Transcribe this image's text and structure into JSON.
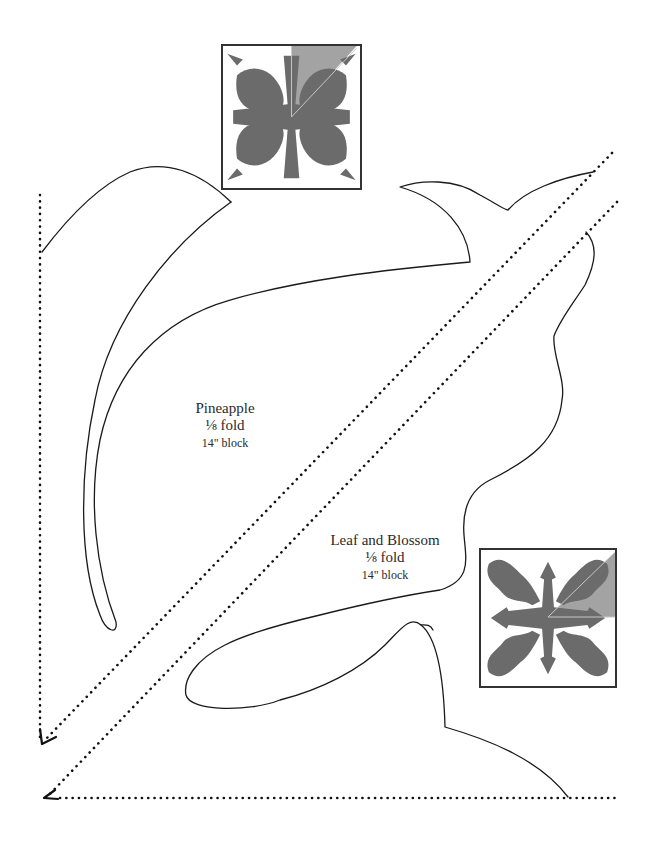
{
  "page": {
    "background": "#ffffff",
    "line_color": "#1a1a1a",
    "applique_fill": "#6b6b6b",
    "fold_highlight": "#a3a3a3"
  },
  "patterns": [
    {
      "id": "pineapple",
      "name": "Pineapple",
      "fold": "⅛ fold",
      "block_size": "14\" block",
      "thumbnail_position": "top"
    },
    {
      "id": "leaf-and-blossom",
      "name": "Leaf and Blossom",
      "fold": "⅛ fold",
      "block_size": "14\" block",
      "thumbnail_position": "bottom-right"
    }
  ],
  "fold_lines": {
    "style": "dotted",
    "count": 4,
    "arrowheads": 2
  }
}
